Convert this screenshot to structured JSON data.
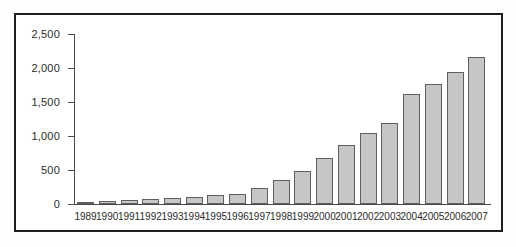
{
  "figure": {
    "background_color": "#ffffff",
    "frame_border_color": "#1f1f1f"
  },
  "chart_data": {
    "type": "bar",
    "title": "",
    "xlabel": "",
    "ylabel": "",
    "categories": [
      "1989",
      "1990",
      "1991",
      "1992",
      "1993",
      "1994",
      "1995",
      "1996",
      "1997",
      "1998",
      "1999",
      "2000",
      "2001",
      "2002",
      "2003",
      "2004",
      "2005",
      "2006",
      "2007"
    ],
    "values": [
      25,
      50,
      65,
      80,
      90,
      100,
      125,
      150,
      235,
      350,
      485,
      675,
      865,
      1050,
      1190,
      1620,
      1760,
      1935,
      2160
    ],
    "ylim": [
      0,
      2500
    ],
    "y_ticks": [
      {
        "label": "0",
        "value": 0
      },
      {
        "label": "500",
        "value": 500
      },
      {
        "label": "1,000",
        "value": 1000
      },
      {
        "label": "1,500",
        "value": 1500
      },
      {
        "label": "2,000",
        "value": 2000
      },
      {
        "label": "2,500",
        "value": 2500
      }
    ],
    "grid": false,
    "legend": false,
    "legend_position": "none",
    "bar_fill_color": "#c6c6c6",
    "bar_border_color": "#5f5f5f",
    "axis_color": "#4a4a4a",
    "tick_text_color": "#2b2b2b"
  }
}
